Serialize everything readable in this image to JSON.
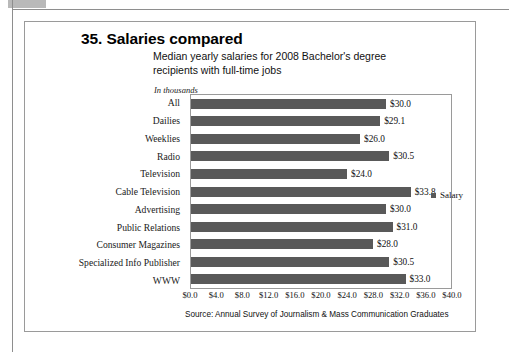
{
  "figure": {
    "title": "35. Salaries compared",
    "subtitle": "Median yearly salaries for 2008 Bachelor's degree recipients with full-time jobs",
    "units_label": "In thousands",
    "source": "Source: Annual Survey of Journalism & Mass Communication Graduates"
  },
  "legend": {
    "label": "Salary",
    "swatch_color": "#595959"
  },
  "colors": {
    "bar": "#595959",
    "border": "#9a9a9a",
    "text": "#111111"
  },
  "chart_data": {
    "type": "bar",
    "orientation": "horizontal",
    "title": "35. Salaries compared",
    "subtitle": "Median yearly salaries for 2008 Bachelor's degree recipients with full-time jobs",
    "xlabel": "",
    "ylabel": "",
    "units": "In thousands",
    "xlim": [
      0,
      40
    ],
    "xtick_step": 4,
    "grid": false,
    "legend_position": "right",
    "categories": [
      "All",
      "Dailies",
      "Weeklies",
      "Radio",
      "Television",
      "Cable Television",
      "Advertising",
      "Public Relations",
      "Consumer Magazines",
      "Specialized Info Publisher",
      "WWW"
    ],
    "series": [
      {
        "name": "Salary",
        "values": [
          30.0,
          29.1,
          26.0,
          30.5,
          24.0,
          33.8,
          30.0,
          31.0,
          28.0,
          30.5,
          33.0
        ]
      }
    ],
    "value_labels": [
      "$30.0",
      "$29.1",
      "$26.0",
      "$30.5",
      "$24.0",
      "$33.8",
      "$30.0",
      "$31.0",
      "$28.0",
      "$30.5",
      "$33.0"
    ],
    "xticklabels": [
      "$0.0",
      "$4.0",
      "$8.0",
      "$12.0",
      "$16.0",
      "$20.0",
      "$24.0",
      "$28.0",
      "$32.0",
      "$36.0",
      "$40.0"
    ],
    "source": "Source: Annual Survey of Journalism & Mass Communication Graduates"
  }
}
